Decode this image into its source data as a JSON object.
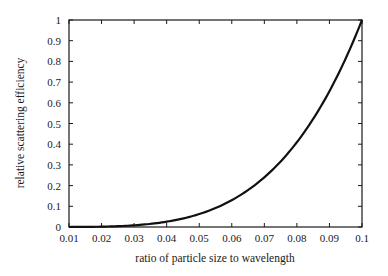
{
  "chart_data": {
    "type": "line",
    "title": "",
    "xlabel": "ratio of particle size to wavelength",
    "ylabel": "relative scattering efficiency",
    "xlim": [
      0.01,
      0.1
    ],
    "ylim": [
      0,
      1
    ],
    "grid": false,
    "legend": null,
    "x_ticks": [
      "0.01",
      "0.02",
      "0.03",
      "0.04",
      "0.05",
      "0.06",
      "0.07",
      "0.08",
      "0.09",
      "0.1"
    ],
    "y_ticks": [
      "0",
      "0.1",
      "0.2",
      "0.3",
      "0.4",
      "0.5",
      "0.6",
      "0.7",
      "0.8",
      "0.9",
      "1"
    ],
    "series": [
      {
        "name": "relative scattering efficiency",
        "x": [
          0.01,
          0.02,
          0.03,
          0.04,
          0.05,
          0.06,
          0.07,
          0.08,
          0.09,
          0.1
        ],
        "values": [
          0.0001,
          0.0016,
          0.0081,
          0.0256,
          0.0625,
          0.1296,
          0.2401,
          0.4096,
          0.6561,
          1.0
        ]
      }
    ]
  }
}
